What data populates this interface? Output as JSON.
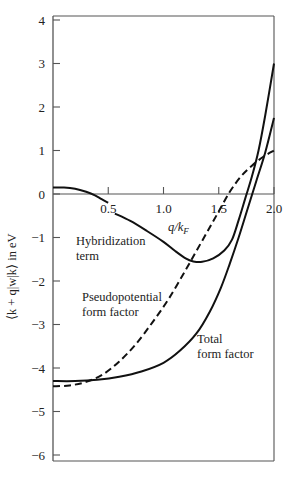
{
  "chart_data": {
    "type": "line",
    "title": "",
    "xlabel": "q/k_F",
    "ylabel": "⟨k + q|w|k⟩ in eV",
    "xlim": [
      0,
      2.0
    ],
    "ylim": [
      -6.15,
      4.35
    ],
    "grid": false,
    "legend": "inline labels",
    "x_ticks": [
      0.5,
      1.0,
      1.5,
      2.0
    ],
    "x_tick_labels": [
      "0.5",
      "1.0",
      "1.5",
      "2.0"
    ],
    "y_ticks": [
      4,
      3,
      2,
      1,
      0,
      -1,
      -2,
      -3,
      -4,
      -5,
      -6
    ],
    "y_tick_labels": [
      "4",
      "3",
      "2",
      "1",
      "0",
      "−1",
      "−2",
      "−3",
      "−4",
      "−5",
      "−6"
    ],
    "series": [
      {
        "name": "Hybridization term",
        "style": "solid",
        "x": [
          0,
          0.1,
          0.2,
          0.3,
          0.38,
          0.44,
          0.5
        ],
        "y": [
          0.15,
          0.15,
          0.12,
          0.05,
          -0.03,
          -0.12,
          -0.2
        ]
      },
      {
        "name": "Hybridization term (cont.)",
        "style": "solid",
        "x": [
          0.56,
          0.7,
          0.85,
          1.0,
          1.1,
          1.2,
          1.27,
          1.35,
          1.45,
          1.55,
          1.62,
          1.68,
          1.74,
          1.8,
          1.86,
          1.92,
          2.0
        ],
        "y": [
          -0.45,
          -0.62,
          -0.85,
          -1.1,
          -1.3,
          -1.48,
          -1.55,
          -1.56,
          -1.48,
          -1.3,
          -1.05,
          -0.6,
          -0.1,
          0.4,
          1.0,
          1.8,
          3.0
        ]
      },
      {
        "name": "Pseudopotential form factor",
        "style": "dashed",
        "x": [
          0,
          0.15,
          0.3,
          0.45,
          0.6,
          0.75,
          0.9,
          1.05,
          1.2,
          1.3,
          1.4,
          1.5,
          1.6,
          1.7,
          1.8,
          1.9,
          2.0
        ],
        "y": [
          -4.42,
          -4.4,
          -4.32,
          -4.15,
          -3.85,
          -3.45,
          -2.95,
          -2.4,
          -1.75,
          -1.3,
          -0.85,
          -0.4,
          0.05,
          0.4,
          0.65,
          0.85,
          1.0
        ]
      },
      {
        "name": "Total form factor",
        "style": "solid",
        "x": [
          0,
          0.2,
          0.4,
          0.6,
          0.8,
          1.0,
          1.15,
          1.3,
          1.42,
          1.52,
          1.6,
          1.68,
          1.76,
          1.84,
          1.92,
          2.0
        ],
        "y": [
          -4.3,
          -4.3,
          -4.27,
          -4.2,
          -4.08,
          -3.88,
          -3.6,
          -3.2,
          -2.7,
          -2.15,
          -1.6,
          -1.0,
          -0.35,
          0.3,
          0.95,
          1.75
        ]
      }
    ],
    "annotations": [
      {
        "text": "Hybridization",
        "x": 0.33,
        "y": -1.05
      },
      {
        "text": "term",
        "x": 0.33,
        "y": -1.4
      },
      {
        "text": "Pseudopotential",
        "x": 0.36,
        "y": -2.55
      },
      {
        "text": "form factor",
        "x": 0.36,
        "y": -2.9
      },
      {
        "text": "Total",
        "x": 1.31,
        "y": -3.45
      },
      {
        "text": "form factor",
        "x": 1.31,
        "y": -3.8
      }
    ]
  },
  "labels": {
    "ylabel": "⟨k + q|w|k⟩ in eV",
    "xlabel": "q/k_F",
    "hybridization_1": "Hybridization",
    "hybridization_2": "term",
    "pseudo_1": "Pseudopotential",
    "pseudo_2": "form factor",
    "total_1": "Total",
    "total_2": "form factor"
  },
  "colors": {
    "axis": "#555555",
    "curve": "#111111",
    "text": "#222222"
  }
}
